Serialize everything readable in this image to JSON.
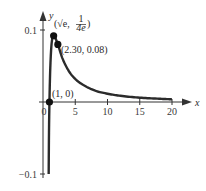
{
  "chart_data": {
    "type": "line",
    "title": "",
    "xlabel": "x",
    "ylabel": "y",
    "xlim": [
      0,
      20
    ],
    "ylim": [
      -0.1,
      0.1
    ],
    "grid": false,
    "x_ticks": [
      {
        "value": 0,
        "label": "0"
      },
      {
        "value": 5,
        "label": "5"
      },
      {
        "value": 10,
        "label": "10"
      },
      {
        "value": 15,
        "label": "15"
      },
      {
        "value": 20,
        "label": "20"
      }
    ],
    "y_ticks": [
      {
        "value": 0.1,
        "label": "0.1"
      },
      {
        "value": -0.1,
        "label": "−0.1"
      }
    ],
    "series": [
      {
        "name": "f(x)",
        "x": [
          0.88,
          0.92,
          1.0,
          1.1,
          1.25,
          1.4,
          1.65,
          2.0,
          2.3,
          3.0,
          4.0,
          5.0,
          6.0,
          8.0,
          10.0,
          12.0,
          15.0,
          18.0,
          20.0
        ],
        "y": [
          -0.1,
          -0.05,
          0.0,
          0.039,
          0.071,
          0.086,
          0.092,
          0.087,
          0.08,
          0.061,
          0.043,
          0.032,
          0.025,
          0.016,
          0.0115,
          0.0086,
          0.006,
          0.0045,
          0.0037
        ]
      }
    ],
    "points": [
      {
        "x": 1.65,
        "y": 0.092,
        "label": "(√e, 1/4e)",
        "label_text_main": "(√e,",
        "label_frac_num": "1",
        "label_frac_den": "4e",
        "label_close": ")"
      },
      {
        "x": 2.3,
        "y": 0.08,
        "label": "(2.30, 0.08)"
      },
      {
        "x": 1.0,
        "y": 0.0,
        "label": "(1, 0)"
      }
    ],
    "legend": null
  }
}
